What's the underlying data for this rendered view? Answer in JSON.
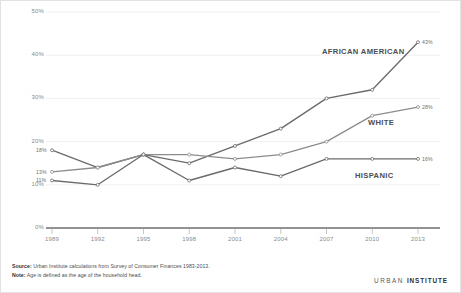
{
  "chart_data": {
    "type": "line",
    "title": "",
    "subtitle": "",
    "xlabel": "",
    "ylabel": "",
    "x": [
      "1989",
      "1992",
      "1995",
      "1998",
      "2001",
      "2004",
      "2007",
      "2010",
      "2013"
    ],
    "xtick_labels": [
      "1989",
      "1992",
      "1995",
      "1998",
      "2001",
      "2004",
      "2007",
      "2010",
      "2013"
    ],
    "ytick_labels": [
      "0%",
      "10%",
      "20%",
      "30%",
      "40%",
      "50%"
    ],
    "ytick_values": [
      0,
      10,
      20,
      30,
      40,
      50
    ],
    "ylim": [
      0,
      50
    ],
    "grid": true,
    "legend_position": "inline-right",
    "series": [
      {
        "name": "AFRICAN AMERICAN",
        "color": "#6b6b6d",
        "values": [
          18,
          14,
          17,
          15,
          19,
          23,
          30,
          32,
          43
        ],
        "start_label": "18%",
        "end_label": "43%"
      },
      {
        "name": "WHITE",
        "color": "#8c8c8e",
        "values": [
          13,
          14,
          17,
          17,
          16,
          17,
          20,
          26,
          28
        ],
        "start_label": "13%",
        "end_label": "28%"
      },
      {
        "name": "HISPANIC",
        "color": "#6b6b6d",
        "values": [
          11,
          10,
          17,
          11,
          14,
          12,
          16,
          16,
          16
        ],
        "start_label": "11%",
        "end_label": "16%"
      }
    ]
  },
  "footer": {
    "source_label": "Source:",
    "source_text": " Urban Institute calculations from Survey of Consumer Finances 1983-2013.",
    "note_label": "Note:",
    "note_text": " Age is defined as the age of the household head.",
    "logo_urban": "URBAN",
    "logo_institute": "INSTITUTE"
  }
}
